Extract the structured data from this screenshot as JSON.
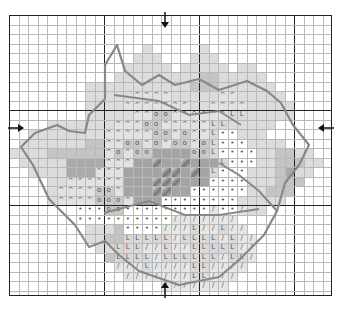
{
  "pattern": {
    "title": "Cross-stitch flower chart",
    "grid": {
      "cols": 34,
      "rows": 29,
      "cell": 9.5,
      "bold_every": 10
    },
    "colors": {
      ".": "#ffffff",
      "a": "#dcdcdc",
      "b": "#c4c4c4",
      "c": "#aaaaaa",
      "^": "#e2e2e2",
      "o": "#c9c9c9",
      "L": "#d9d9d9",
      "/": "#e6e6e6",
      "•": "#ffffff",
      "g": "#9a9a9a",
      "d": "#a4a4a4"
    },
    "symbols": {
      "^": "^",
      "o": "o",
      "L": "L",
      "/": "/",
      "•": "•"
    },
    "rows": [
      "..................................",
      "..................................",
      "..................................",
      "..............a.....a.............",
      ".............aaa...aaa............",
      "............aaaaa.aaaaa.aa........",
      "...........aaaaaaaaabbaaaaa.......",
      "........aaaaaaaaaaabbbaaaaaa......",
      "........aaaaa^^^^aaaaa^^aaaaa.....",
      "........aaaa^^^^^^^aa^^^^aaaaa....",
      "........aaaaa^^oo^^^^^^LLaaaaa....",
      "....aaaaaaa^^^oo^^^^^LLaaaaa......",
      "..aaaaaaaa^^^^^oo^o^^L••aaa.......",
      ".aaaaaaabb^^oo^o^oo^oL•••aaaa.....",
      "aaaabbbbbb^o^ooddddooL••••aabbaa..",
      ".aaaaacccc^^^ddgddgdddL•••aabbbaa.",
      "..aaaaccc^^^ddddggdgdL•••aaabcaa..",
      "....aa^^^^^^dddgggddd••••aaabbb...",
      "....a^^^^oo^dddggdd••••••aabbb....",
      "....a^^^^ooo^ddd••••••••aaaaa.....",
      ".......•••oo•••••••••/••/aa.......",
      ".......••••••••••///////..........",
      "........aaab••••///L//L//.........",
      "........aabbLLLLL/LLLL/L//........",
      ".........aaLLL//L//LLLLL//........",
      "..........bLLLL/LLLLLL/LL/........",
      "...........///L////LL////.........",
      "............///////LL///..........",
      "................///////..........."
    ],
    "arrows": [
      {
        "id": "top",
        "direction": "down",
        "x": 165,
        "y": 20
      },
      {
        "id": "bottom",
        "direction": "up",
        "x": 165,
        "y": 290
      },
      {
        "id": "left",
        "direction": "right",
        "x": 16,
        "y": 128
      },
      {
        "id": "right",
        "direction": "left",
        "x": 326,
        "y": 128
      }
    ]
  }
}
